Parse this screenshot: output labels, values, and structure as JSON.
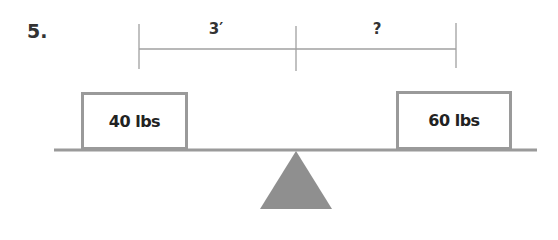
{
  "problem": {
    "number": "5.",
    "dimensions": {
      "left_distance": "3′",
      "right_distance": "?"
    },
    "weights": {
      "left": "40 lbs",
      "right": "60 lbs"
    },
    "colors": {
      "lines": "#9a9a9a",
      "fulcrum": "#8f8f8f",
      "text": "#222222"
    }
  }
}
